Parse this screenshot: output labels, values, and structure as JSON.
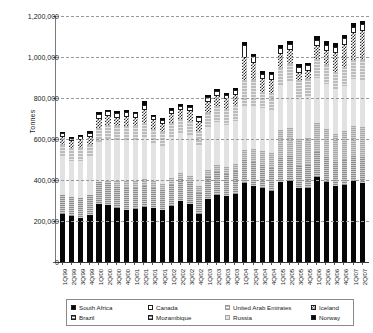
{
  "chart_data": {
    "type": "bar",
    "title": "",
    "subtitle": "",
    "xlabel": "",
    "ylabel": "Tonnes",
    "ylim": [
      0,
      1200000
    ],
    "ytick_values": [
      0,
      200000,
      400000,
      600000,
      800000,
      1000000,
      1200000
    ],
    "ytick_labels": [
      "0",
      "200,000",
      "400,000",
      "600,000",
      "800,000",
      "1,000,000",
      "1,200,000"
    ],
    "grid": true,
    "grid_axis": "y",
    "stacked": true,
    "legend_position": "bottom",
    "legend_columns": 4,
    "categories": [
      "1Q/99",
      "2Q/99",
      "3Q/99",
      "4Q/99",
      "1Q/00",
      "2Q/00",
      "3Q/00",
      "4Q/00",
      "1Q/01",
      "2Q/01",
      "3Q/01",
      "4Q/01",
      "1Q/02",
      "2Q/02",
      "3Q/02",
      "4Q/02",
      "1Q/03",
      "2Q/03",
      "3Q/03",
      "4Q/03",
      "1Q/04",
      "2Q/04",
      "3Q/04",
      "4Q/04",
      "1Q/05",
      "2Q/05",
      "3Q/05",
      "4Q/05",
      "1Q/06",
      "2Q/06",
      "3Q/06",
      "4Q/06",
      "1Q/07",
      "2Q/07"
    ],
    "series": [
      {
        "name": "South Africa",
        "color": "#070707",
        "pattern": "solid",
        "values": [
          232000,
          224000,
          216000,
          230000,
          285000,
          278000,
          264000,
          256000,
          260000,
          266000,
          262000,
          253000,
          274000,
          299000,
          281000,
          232000,
          306000,
          329000,
          321000,
          331000,
          383000,
          371000,
          363000,
          345000,
          388000,
          396000,
          360000,
          360000,
          413000,
          389000,
          370000,
          377000,
          395000,
          385000
        ]
      },
      {
        "name": "Brazil",
        "color": "#8e8e8e",
        "pattern": "horizontal-lines",
        "values": [
          96000,
          94000,
          97000,
          96000,
          103000,
          106000,
          104000,
          106000,
          102000,
          104000,
          98000,
          96000,
          104000,
          104000,
          107000,
          106000,
          110000,
          112000,
          110000,
          112000,
          117000,
          116000,
          112000,
          115000,
          118000,
          120000,
          110000,
          111000,
          122000,
          121000,
          118000,
          121000,
          124000,
          126000
        ]
      },
      {
        "name": "Mozambique",
        "color": "#a9a9a9",
        "pattern": "horizontal-lines",
        "values": [
          0,
          0,
          0,
          0,
          0,
          12000,
          26000,
          32000,
          34000,
          34000,
          33000,
          32000,
          34000,
          33000,
          34000,
          33000,
          35000,
          34000,
          34000,
          35000,
          48000,
          62000,
          68000,
          70000,
          138000,
          140000,
          132000,
          134000,
          142000,
          140000,
          137000,
          140000,
          144000,
          146000
        ]
      },
      {
        "name": "Russia",
        "color": "#e2e2e2",
        "pattern": "solid",
        "values": [
          182000,
          176000,
          182000,
          184000,
          198000,
          200000,
          198000,
          200000,
          196000,
          200000,
          188000,
          186000,
          194000,
          190000,
          196000,
          196000,
          202000,
          206000,
          204000,
          208000,
          214000,
          212000,
          208000,
          212000,
          216000,
          220000,
          204000,
          206000,
          222000,
          220000,
          216000,
          220000,
          228000,
          232000
        ]
      },
      {
        "name": "United Arab Emirates",
        "color": "#bdbdbd",
        "pattern": "light-horizontal-lines",
        "values": [
          62000,
          60000,
          62000,
          62000,
          70000,
          72000,
          70000,
          72000,
          70000,
          72000,
          68000,
          66000,
          72000,
          70000,
          72000,
          72000,
          76000,
          78000,
          76000,
          78000,
          124000,
          126000,
          80000,
          83000,
          87000,
          88000,
          80000,
          81000,
          90000,
          90000,
          88000,
          92000,
          96000,
          98000
        ]
      },
      {
        "name": "Iceland",
        "color": "#ffffff",
        "pattern": "checker-hatch",
        "values": [
          36000,
          34000,
          36000,
          37000,
          42000,
          44000,
          43000,
          44000,
          42000,
          68000,
          42000,
          42000,
          44000,
          44000,
          46000,
          46000,
          50000,
          50000,
          48000,
          50000,
          108000,
          86000,
          60000,
          62000,
          66000,
          68000,
          38000,
          39000,
          66000,
          70000,
          92000,
          110000,
          128000,
          138000
        ]
      },
      {
        "name": "Canada",
        "color": "#ffffff",
        "pattern": "outlined",
        "values": [
          20000,
          18000,
          20000,
          20000,
          24000,
          24000,
          22000,
          24000,
          22000,
          22000,
          20000,
          20000,
          22000,
          22000,
          22000,
          22000,
          26000,
          26000,
          24000,
          26000,
          66000,
          30000,
          28000,
          28000,
          30000,
          30000,
          28000,
          28000,
          30000,
          30000,
          30000,
          32000,
          34000,
          34000
        ]
      },
      {
        "name": "Norway",
        "color": "#070707",
        "pattern": "solid",
        "values": [
          6000,
          6000,
          6000,
          8000,
          8000,
          8000,
          8000,
          8000,
          8000,
          18000,
          8000,
          8000,
          8000,
          8000,
          10000,
          8000,
          10000,
          10000,
          10000,
          10000,
          14000,
          14000,
          12000,
          12000,
          14000,
          16000,
          12000,
          12000,
          16000,
          16000,
          16000,
          18000,
          18000,
          18000
        ]
      }
    ],
    "totals": [
      634000,
      612000,
      619000,
      637000,
      730000,
      744000,
      735000,
      742000,
      734000,
      784000,
      719000,
      703000,
      752000,
      770000,
      768000,
      715000,
      815000,
      845000,
      827000,
      850000,
      1075000,
      1017000,
      931000,
      927000,
      1277000,
      1078000,
      964000,
      971000,
      1101000,
      1076000,
      1067000,
      1110000,
      1167000,
      1177000
    ]
  },
  "legend": {
    "entries": [
      {
        "label": "South Africa",
        "swatch": "sw-south-africa"
      },
      {
        "label": "Canada",
        "swatch": "sw-canada"
      },
      {
        "label": "United Arab Emirates",
        "swatch": "sw-uae"
      },
      {
        "label": "Iceland",
        "swatch": "sw-iceland"
      },
      {
        "label": "Brazil",
        "swatch": "sw-brazil"
      },
      {
        "label": "Mozambique",
        "swatch": "sw-mozambique"
      },
      {
        "label": "Russia",
        "swatch": "sw-russia"
      },
      {
        "label": "Norway",
        "swatch": "sw-norway"
      }
    ]
  },
  "colors": {
    "axis": "#3a3a3a",
    "gridline": "#9a9a9a",
    "text": "#1a1a1a",
    "background": "#ffffff"
  }
}
